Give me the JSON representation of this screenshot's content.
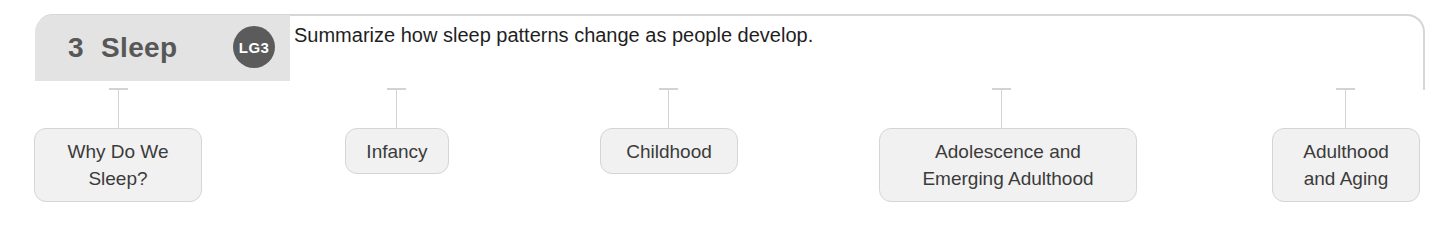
{
  "header": {
    "chapter_number": "3",
    "chapter_title": "Sleep",
    "badge_label": "LG3",
    "goal_text": "Summarize how sleep patterns change as people develop."
  },
  "colors": {
    "tab_background": "#e3e3e3",
    "badge_background": "#5b5b5b",
    "badge_text": "#ffffff",
    "box_background": "#f1f1f1",
    "box_border": "#d5d5d5",
    "frame_border": "#d6d6d6",
    "title_text": "#575757",
    "body_text": "#1f1f1f"
  },
  "topics": [
    {
      "label": "Why Do We\nSleep?",
      "left": 34,
      "top": 128,
      "width": 168,
      "height": 74,
      "connector_x": 118
    },
    {
      "label": "Infancy",
      "left": 345,
      "top": 128,
      "width": 104,
      "height": 46,
      "connector_x": 396
    },
    {
      "label": "Childhood",
      "left": 600,
      "top": 128,
      "width": 138,
      "height": 46,
      "connector_x": 668
    },
    {
      "label": "Adolescence and\nEmerging Adulthood",
      "left": 879,
      "top": 128,
      "width": 258,
      "height": 74,
      "connector_x": 1001
    },
    {
      "label": "Adulthood\nand Aging",
      "left": 1272,
      "top": 128,
      "width": 148,
      "height": 74,
      "connector_x": 1345
    }
  ],
  "connector_geometry": {
    "top": 88,
    "bottom": 128
  }
}
